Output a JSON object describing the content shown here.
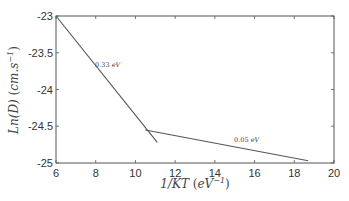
{
  "chart_data": {
    "type": "line",
    "title": "",
    "xlabel": "1/KT (eV^-1)",
    "ylabel": "Ln(D) (cm.s^-1)",
    "xlim": [
      6,
      20
    ],
    "ylim": [
      -25,
      -23
    ],
    "xticks": [
      6,
      8,
      10,
      12,
      14,
      16,
      18,
      20
    ],
    "yticks": [
      -23,
      -23.5,
      -24,
      -24.5,
      -25
    ],
    "xtick_labels": [
      "6",
      "8",
      "10",
      "12",
      "14",
      "16",
      "18",
      "20"
    ],
    "ytick_labels": [
      "-23",
      "-23.5",
      "-24",
      "-24.5",
      "-25"
    ],
    "grid": false,
    "legend": null,
    "series": [
      {
        "name": "0.33 eV fit",
        "x": [
          6.0,
          11.1
        ],
        "y": [
          -23.0,
          -24.72
        ]
      },
      {
        "name": "0.05 eV fit",
        "x": [
          10.5,
          18.7
        ],
        "y": [
          -24.55,
          -24.97
        ]
      }
    ],
    "annotations": [
      {
        "text": "0.33 eV",
        "x": 8.6,
        "y": -23.7
      },
      {
        "text": "0.05 eV",
        "x": 15.6,
        "y": -24.72
      }
    ],
    "line_color": "#555555"
  }
}
